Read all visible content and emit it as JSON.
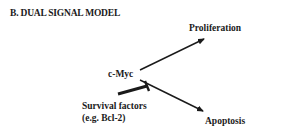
{
  "diagram": {
    "title": "B.  DUAL SIGNAL MODEL",
    "nodes": {
      "source": "c-Myc",
      "top_outcome": "Proliferation",
      "bottom_outcome": "Apoptosis",
      "inhibitor_line1": "Survival factors",
      "inhibitor_line2": "(e.g. Bcl-2)"
    },
    "edges": [
      {
        "from": "c-Myc",
        "to": "Proliferation",
        "type": "activation-arrow"
      },
      {
        "from": "c-Myc",
        "to": "Apoptosis",
        "type": "activation-arrow"
      },
      {
        "from": "Survival factors (e.g. Bcl-2)",
        "to": "c-Myc → Apoptosis",
        "type": "inhibition-bar"
      }
    ],
    "colors": {
      "ink": "#1a1a1a",
      "background": "#ffffff"
    }
  }
}
